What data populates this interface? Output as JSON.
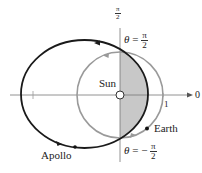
{
  "diagram": {
    "axes": {
      "polar_axis_label": "0",
      "vertical_axis_label": {
        "numerator": "π",
        "denominator": "2"
      },
      "tick_label": "1"
    },
    "labels": {
      "sun": "Sun",
      "earth": "Earth",
      "apollo": "Apollo",
      "theta_top": {
        "lhs": "θ",
        "eq": "=",
        "sign": "",
        "numerator": "π",
        "denominator": "2"
      },
      "theta_bottom": {
        "lhs": "θ",
        "eq": "=",
        "sign": "−",
        "numerator": "π",
        "denominator": "2"
      }
    },
    "colors": {
      "apollo_orbit": "#1a1a1a",
      "earth_orbit": "#9a9a9a",
      "shaded_region": "#c8c8c8",
      "axes": "#555555"
    }
  }
}
